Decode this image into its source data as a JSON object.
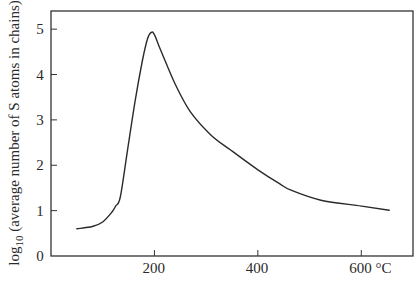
{
  "chart_data": {
    "type": "line",
    "title": "",
    "xlabel": "°C",
    "ylabel_prefix": "log",
    "ylabel_subscript": "10",
    "ylabel_rest": " (average number of S atoms in chains)",
    "ylabel": "log10 (average number of S atoms in chains)",
    "xlim": [
      0,
      700
    ],
    "ylim": [
      0,
      5.4
    ],
    "grid": false,
    "legend": null,
    "x_ticks": [
      200,
      400,
      600
    ],
    "x_tick_labels": [
      "200",
      "400",
      "600 °C"
    ],
    "y_ticks": [
      0,
      1,
      2,
      3,
      4,
      5
    ],
    "y_tick_labels": [
      "0",
      "1",
      "2",
      "3",
      "4",
      "5"
    ],
    "series": [
      {
        "name": "Sulfur chain length",
        "color": "#2a2a2a",
        "x": [
          50,
          80,
          100,
          118,
          125,
          134,
          148,
          163,
          177,
          187,
          194,
          200,
          212,
          241,
          270,
          309,
          348,
          400,
          441,
          464,
          522,
          600,
          654
        ],
        "values": [
          0.6,
          0.65,
          0.75,
          0.97,
          1.1,
          1.3,
          2.33,
          3.44,
          4.32,
          4.8,
          4.93,
          4.88,
          4.54,
          3.77,
          3.17,
          2.67,
          2.33,
          1.9,
          1.6,
          1.45,
          1.23,
          1.1,
          1.01
        ]
      }
    ]
  },
  "plot_area": {
    "left": 51,
    "top": 11,
    "right": 413,
    "bottom": 256
  }
}
